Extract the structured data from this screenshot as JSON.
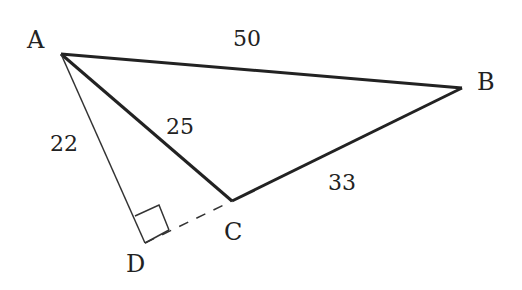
{
  "diagram": {
    "type": "geometry-triangle",
    "points": {
      "A": {
        "label": "A",
        "x": 61,
        "y": 54
      },
      "B": {
        "label": "B",
        "x": 462,
        "y": 88
      },
      "C": {
        "label": "C",
        "x": 232,
        "y": 201
      },
      "D": {
        "label": "D",
        "x": 145,
        "y": 243
      }
    },
    "segments": [
      {
        "from": "A",
        "to": "B",
        "label": "50",
        "style": "thick"
      },
      {
        "from": "A",
        "to": "C",
        "label": "25",
        "style": "thick"
      },
      {
        "from": "B",
        "to": "C",
        "label": "33",
        "style": "thick"
      },
      {
        "from": "A",
        "to": "D",
        "label": "22",
        "style": "thin"
      },
      {
        "from": "D",
        "to": "C",
        "label": "",
        "style": "dashed"
      }
    ],
    "right_angle_at": "D",
    "line_color": "#222222"
  }
}
